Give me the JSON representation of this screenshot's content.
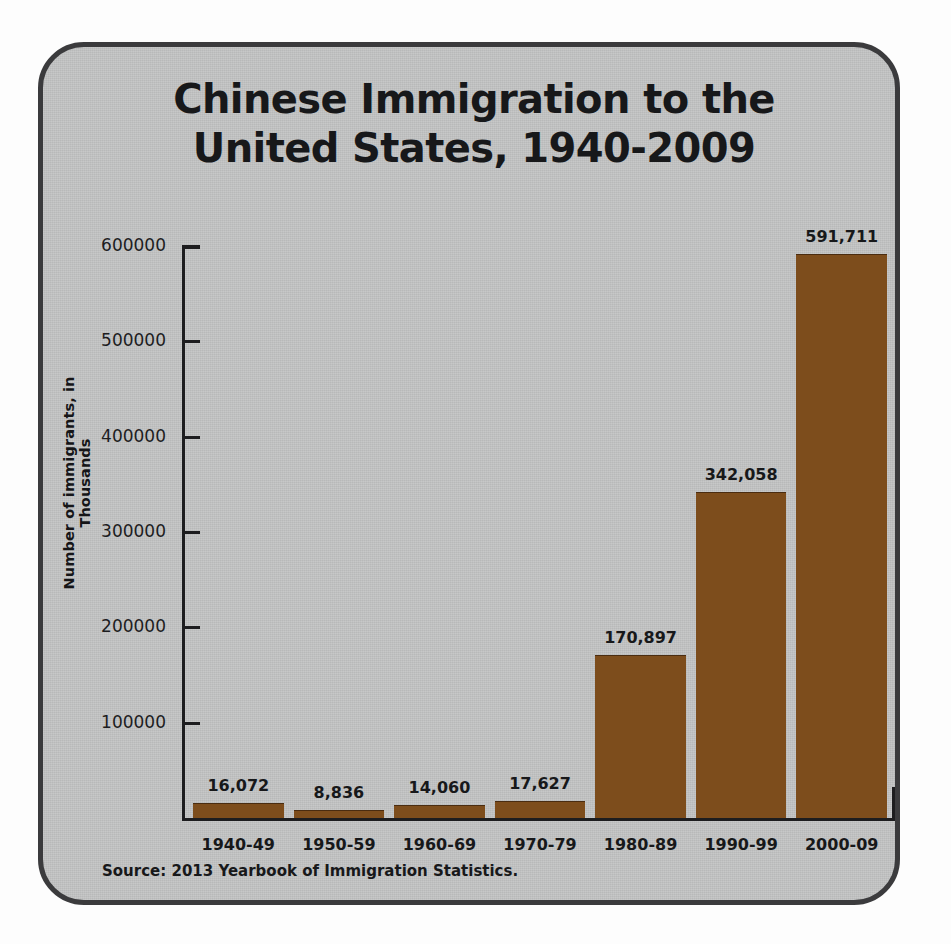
{
  "chart_data": {
    "type": "bar",
    "title": "Chinese Immigration to the United States, 1940-2009",
    "title_lines": [
      "Chinese Immigration to the",
      "United States, 1940-2009"
    ],
    "xlabel": "",
    "ylabel": "Number of immigrants, in Thousands",
    "categories": [
      "1940-49",
      "1950-59",
      "1960-69",
      "1970-79",
      "1980-89",
      "1990-99",
      "2000-09"
    ],
    "values": [
      16072,
      8836,
      14060,
      17627,
      170897,
      342058,
      591711
    ],
    "value_labels": [
      "16,072",
      "8,836",
      "14,060",
      "17,627",
      "170,897",
      "342,058",
      "591,711"
    ],
    "ylim": [
      0,
      620000
    ],
    "yticks": [
      100000,
      200000,
      300000,
      400000,
      500000,
      600000
    ],
    "ytick_labels": [
      "100000",
      "200000",
      "300000",
      "400000",
      "500000",
      "600000"
    ],
    "grid": false,
    "legend": null,
    "bar_color": "#7d4d1c",
    "axis_color": "#1d1d1f",
    "background_color": "#c3c4c4",
    "frame_color": "#3b3b3d",
    "text_color": "#17181a",
    "source": "Source: 2013 Yearbook of Immigration Statistics."
  }
}
